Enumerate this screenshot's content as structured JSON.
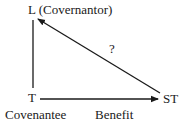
{
  "nodes": {
    "L": {
      "label": "L (Covernantor)"
    },
    "T": {
      "label": "T",
      "sublabel": "Covenantee"
    },
    "ST": {
      "label": "ST"
    }
  },
  "edges": {
    "T_to_ST": {
      "label": "Benefit"
    },
    "ST_to_L": {
      "label": "?"
    }
  },
  "colors": {
    "ink": "#1a1a1a",
    "background": "#ffffff"
  }
}
